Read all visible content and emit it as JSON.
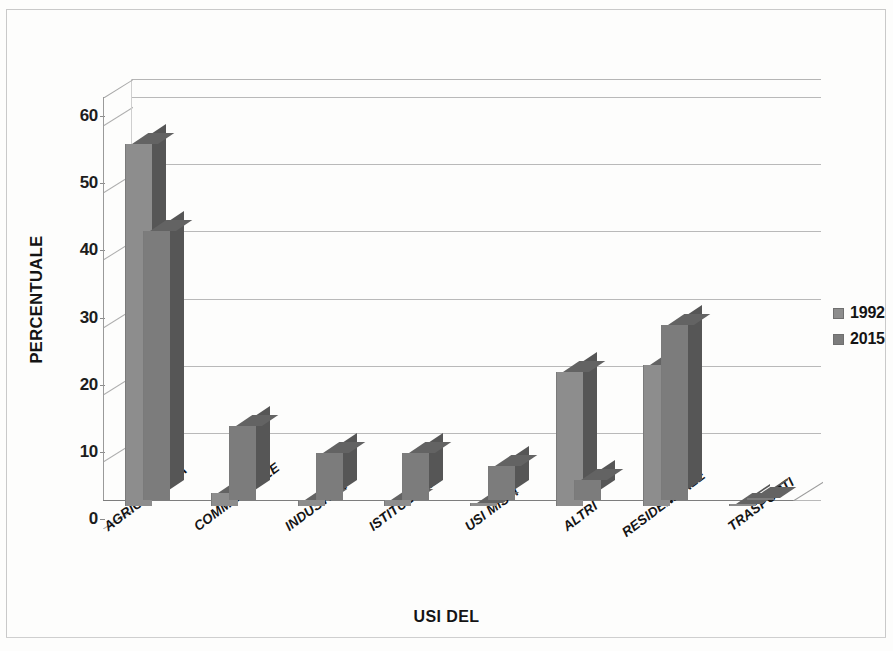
{
  "chart_data": {
    "type": "bar",
    "title": "",
    "xlabel": "USI DEL",
    "ylabel": "PERCENTUALE",
    "ylim": [
      0,
      60
    ],
    "yticks": [
      0,
      10,
      20,
      30,
      40,
      50,
      60
    ],
    "grid": true,
    "legend_position": "right",
    "style": "3d-clustered-column",
    "categories": [
      "AGRICOLTURA",
      "COMMERCIALE",
      "INDUSTRIE",
      "ISTITUZIONE",
      "USI MISTI",
      "ALTRI",
      "RESIDENZIALE",
      "TRASPORTI"
    ],
    "series": [
      {
        "name": "1992",
        "color": "#8d8d8d",
        "values": [
          54,
          2,
          1,
          1,
          0.5,
          20,
          21,
          0.3
        ]
      },
      {
        "name": "2015",
        "color": "#7c7c7c",
        "values": [
          40,
          11,
          7,
          7,
          5,
          3,
          26,
          0.3
        ]
      }
    ]
  },
  "axes": {
    "y_title": "PERCENTUALE",
    "x_title": "USI DEL",
    "y_tick_labels": [
      "60",
      "50",
      "40",
      "30",
      "20",
      "10",
      "0"
    ]
  },
  "legend": {
    "items": [
      {
        "label": "1992",
        "swatch": "#8d8d8d"
      },
      {
        "label": "2015",
        "swatch": "#7c7c7c"
      }
    ]
  }
}
